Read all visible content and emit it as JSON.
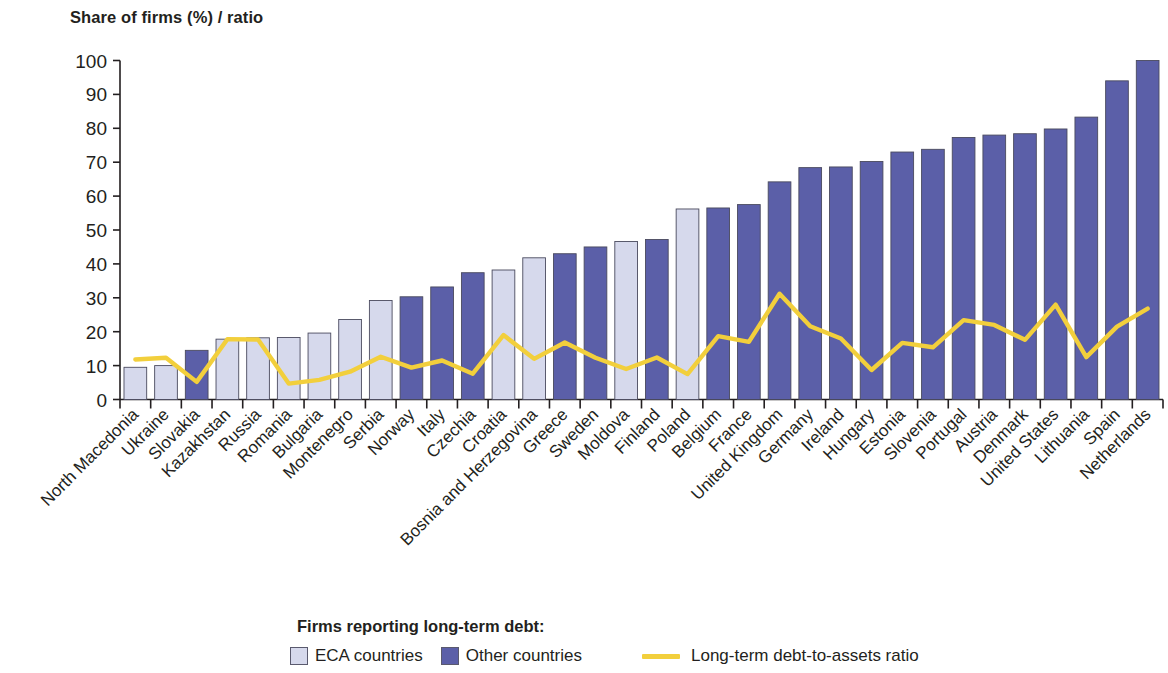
{
  "axis_title": "Share of firms (%) / ratio",
  "legend": {
    "title": "Firms reporting long-term debt:",
    "eca_label": "ECA countries",
    "other_label": "Other countries",
    "line_label": "Long-term debt-to-assets ratio",
    "eca_color": "#d6d9ec",
    "other_color": "#5b5fa8",
    "line_color": "#f2cf3c"
  },
  "chart_data": {
    "type": "bar",
    "title": "Share of firms (%) / ratio",
    "xlabel": "",
    "ylabel": "Share of firms (%) / ratio",
    "ylim": [
      0,
      100
    ],
    "yticks": [
      0,
      10,
      20,
      30,
      40,
      50,
      60,
      70,
      80,
      90,
      100
    ],
    "grid": false,
    "legend_position": "bottom",
    "categories": [
      "North Macedonia",
      "Ukraine",
      "Slovakia",
      "Kazakhstan",
      "Russia",
      "Romania",
      "Bulgaria",
      "Montenegro",
      "Serbia",
      "Norway",
      "Italy",
      "Czechia",
      "Croatia",
      "Bosnia and Herzegovina",
      "Greece",
      "Sweden",
      "Moldova",
      "Finland",
      "Poland",
      "Belgium",
      "France",
      "United Kingdom",
      "Germany",
      "Ireland",
      "Hungary",
      "Estonia",
      "Slovenia",
      "Portugal",
      "Austria",
      "Denmark",
      "United States",
      "Lithuania",
      "Spain",
      "Netherlands"
    ],
    "groups": [
      "ECA countries",
      "ECA countries",
      "Other countries",
      "ECA countries",
      "ECA countries",
      "ECA countries",
      "ECA countries",
      "ECA countries",
      "ECA countries",
      "Other countries",
      "Other countries",
      "Other countries",
      "ECA countries",
      "ECA countries",
      "Other countries",
      "Other countries",
      "ECA countries",
      "Other countries",
      "ECA countries",
      "Other countries",
      "Other countries",
      "Other countries",
      "Other countries",
      "Other countries",
      "Other countries",
      "Other countries",
      "Other countries",
      "Other countries",
      "Other countries",
      "Other countries",
      "Other countries",
      "Other countries",
      "Other countries",
      "Other countries"
    ],
    "series": [
      {
        "name": "Firms reporting long-term debt",
        "type": "bar",
        "values": [
          9.5,
          10.0,
          14.5,
          17.8,
          18.2,
          18.3,
          19.6,
          23.6,
          29.2,
          30.3,
          33.2,
          37.4,
          38.2,
          41.8,
          43.0,
          45.0,
          46.6,
          47.2,
          56.2,
          56.5,
          57.5,
          64.2,
          68.4,
          68.6,
          70.2,
          73.0,
          73.8,
          77.3,
          78.0,
          78.4,
          79.8,
          83.3,
          94.0,
          100.0
        ]
      },
      {
        "name": "Long-term debt-to-assets ratio",
        "type": "line",
        "color": "#f2cf3c",
        "values": [
          11.8,
          12.3,
          5.2,
          17.8,
          17.7,
          4.7,
          5.8,
          8.2,
          12.6,
          9.4,
          11.5,
          7.6,
          19.0,
          12.0,
          16.8,
          12.3,
          9.0,
          12.4,
          7.5,
          18.7,
          17.0,
          31.2,
          21.6,
          18.0,
          8.7,
          16.7,
          15.4,
          23.4,
          22.0,
          17.6,
          28.0,
          12.5,
          21.5,
          26.8
        ]
      }
    ]
  }
}
